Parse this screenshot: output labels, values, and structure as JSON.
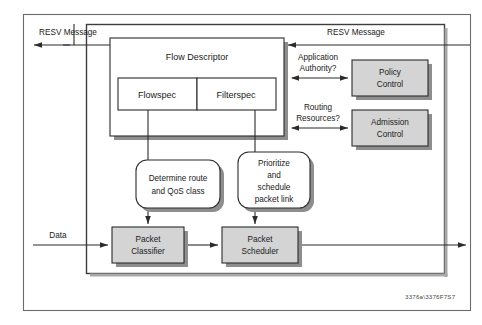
{
  "diagram": {
    "caption": "3376a\\3376F7S7",
    "colors": {
      "box_fill_gray": "#d4d4d4",
      "box_fill_white": "#ffffff",
      "stroke": "#2b2b2b",
      "frame": "#6b6b6b",
      "shadow": "#8e8e8e",
      "text": "#1a1a1a"
    },
    "labels": {
      "resv_left": "RESV Message",
      "resv_right": "RESV Message",
      "data": "Data",
      "application_authority": "Application\nAuthority?",
      "application_authority_line1": "Application",
      "application_authority_line2": "Authority?",
      "routing_resources_line1": "Routing",
      "routing_resources_line2": "Resources?"
    },
    "boxes": [
      {
        "id": "flow-descriptor",
        "label": "Flow Descriptor",
        "style": "white",
        "x": 110,
        "y": 38,
        "w": 174,
        "h": 98
      },
      {
        "id": "flowspec",
        "label": "Flowspec",
        "style": "white",
        "x": 118,
        "y": 78,
        "w": 79,
        "h": 32
      },
      {
        "id": "filterspec",
        "label": "Filterspec",
        "style": "white",
        "x": 197,
        "y": 78,
        "w": 79,
        "h": 32
      },
      {
        "id": "policy-control",
        "label_line1": "Policy",
        "label_line2": "Control",
        "style": "gray",
        "x": 352,
        "y": 60,
        "w": 76,
        "h": 36
      },
      {
        "id": "admission-control",
        "label_line1": "Admission",
        "label_line2": "Control",
        "style": "gray",
        "x": 352,
        "y": 110,
        "w": 76,
        "h": 36
      },
      {
        "id": "packet-classifier",
        "label_line1": "Packet",
        "label_line2": "Classifier",
        "style": "gray",
        "x": 112,
        "y": 227,
        "w": 72,
        "h": 36
      },
      {
        "id": "packet-scheduler",
        "label_line1": "Packet",
        "label_line2": "Scheduler",
        "style": "gray",
        "x": 222,
        "y": 227,
        "w": 76,
        "h": 36
      }
    ],
    "rounded_boxes": [
      {
        "id": "determine-route",
        "lines": [
          "Determine route",
          "and QoS class"
        ],
        "x": 136,
        "y": 160,
        "w": 84,
        "h": 48
      },
      {
        "id": "prioritize-schedule",
        "lines": [
          "Prioritize",
          "and",
          "schedule",
          "packet link"
        ],
        "x": 238,
        "y": 152,
        "w": 72,
        "h": 56
      }
    ]
  }
}
